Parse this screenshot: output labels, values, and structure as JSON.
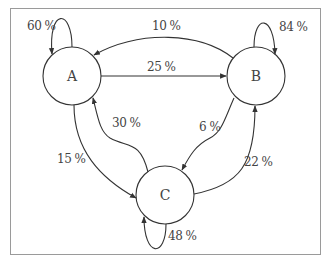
{
  "diagram": {
    "type": "markov-chain",
    "nodes": [
      {
        "id": "A",
        "label": "A"
      },
      {
        "id": "B",
        "label": "B"
      },
      {
        "id": "C",
        "label": "C"
      }
    ],
    "edges": [
      {
        "from": "A",
        "to": "A",
        "label": "60 %"
      },
      {
        "from": "B",
        "to": "A",
        "label": "10 %"
      },
      {
        "from": "A",
        "to": "B",
        "label": "25 %"
      },
      {
        "from": "B",
        "to": "B",
        "label": "84 %"
      },
      {
        "from": "C",
        "to": "A",
        "label": "30 %"
      },
      {
        "from": "B",
        "to": "C",
        "label": "6 %"
      },
      {
        "from": "A",
        "to": "C",
        "label": "15 %"
      },
      {
        "from": "C",
        "to": "B",
        "label": "22 %"
      },
      {
        "from": "C",
        "to": "C",
        "label": "48 %"
      }
    ]
  },
  "colors": {
    "stroke": "#333333",
    "text": "#444444",
    "frame": "#9a9a9a"
  }
}
